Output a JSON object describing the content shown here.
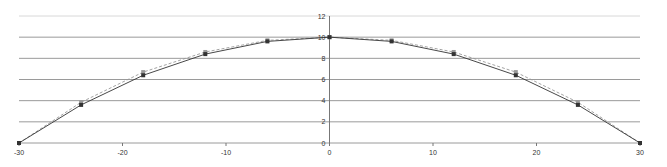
{
  "chart_data": {
    "type": "line",
    "title": "",
    "xlabel": "",
    "ylabel": "",
    "xlim": [
      -30,
      30
    ],
    "ylim": [
      0,
      12
    ],
    "x_ticks": [
      -30,
      -20,
      -10,
      0,
      10,
      20,
      30
    ],
    "y_ticks": [
      0,
      2,
      4,
      6,
      8,
      10,
      12
    ],
    "grid": "horizontal",
    "legend": "none",
    "x": [
      -30,
      -24,
      -18,
      -12,
      -6,
      0,
      6,
      12,
      18,
      24,
      30
    ],
    "series": [
      {
        "name": "Series 1",
        "color": "#333333",
        "marker": "square",
        "values": [
          0,
          3.6,
          6.4,
          8.4,
          9.6,
          10,
          9.6,
          8.4,
          6.4,
          3.6,
          0
        ]
      },
      {
        "name": "Series 2",
        "color": "#999999",
        "marker": "square",
        "dashed": true,
        "values": [
          0,
          3.85,
          6.7,
          8.6,
          9.7,
          10,
          9.7,
          8.6,
          6.7,
          3.85,
          0
        ]
      }
    ]
  }
}
